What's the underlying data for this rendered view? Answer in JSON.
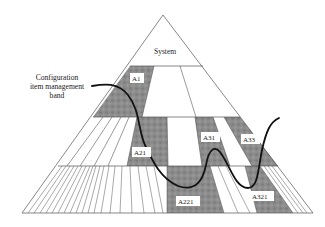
{
  "diagram": {
    "type": "pyramid",
    "title_box": "System",
    "band_label": [
      "Configuration",
      "item management",
      "band"
    ],
    "items": [
      {
        "id": "A1",
        "level": 1
      },
      {
        "id": "A21",
        "level": 2
      },
      {
        "id": "A31",
        "level": 2
      },
      {
        "id": "A33",
        "level": 2
      },
      {
        "id": "A221",
        "level": 3
      },
      {
        "id": "A321",
        "level": 3
      }
    ],
    "colors": {
      "shaded": "#8a8a8a",
      "line": "#555555",
      "curve": "#111111",
      "background": "#ffffff"
    }
  }
}
